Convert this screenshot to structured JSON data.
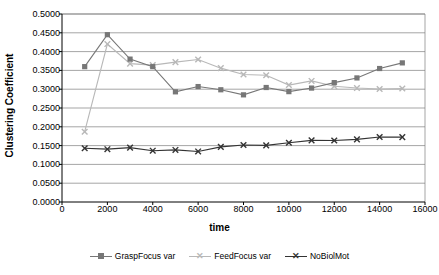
{
  "chart_data": {
    "type": "line",
    "title": "",
    "xlabel": "time",
    "ylabel": "Clustering Coefficient",
    "xlim": [
      0,
      16000
    ],
    "ylim": [
      0.0,
      0.5
    ],
    "grid": true,
    "legend_position": "bottom",
    "x_ticks": [
      "0",
      "2000",
      "4000",
      "6000",
      "8000",
      "10000",
      "12000",
      "14000",
      "16000"
    ],
    "x_tick_values": [
      0,
      2000,
      4000,
      6000,
      8000,
      10000,
      12000,
      14000,
      16000
    ],
    "y_ticks": [
      "0.0000",
      "0.0500",
      "0.1000",
      "0.1500",
      "0.2000",
      "0.2500",
      "0.3000",
      "0.3500",
      "0.4000",
      "0.4500",
      "0.5000"
    ],
    "y_tick_values": [
      0.0,
      0.05,
      0.1,
      0.15,
      0.2,
      0.25,
      0.3,
      0.35,
      0.4,
      0.45,
      0.5
    ],
    "x": [
      1000,
      2000,
      3000,
      4000,
      5000,
      6000,
      7000,
      8000,
      9000,
      10000,
      11000,
      12000,
      13000,
      14000,
      15000
    ],
    "series": [
      {
        "name": "GraspFocus var",
        "color": "#777777",
        "marker": "square",
        "values": [
          0.36,
          0.445,
          0.38,
          0.36,
          0.293,
          0.307,
          0.2985,
          0.285,
          0.3045,
          0.2935,
          0.303,
          0.3175,
          0.33,
          0.355,
          0.37
        ]
      },
      {
        "name": "FeedFocus var",
        "color": "#b8b8b8",
        "marker": "x",
        "values": [
          0.187,
          0.42,
          0.368,
          0.364,
          0.372,
          0.379,
          0.356,
          0.339,
          0.337,
          0.311,
          0.322,
          0.308,
          0.303,
          0.3005,
          0.302
        ]
      },
      {
        "name": "NoBiolMot",
        "color": "#333333",
        "marker": "x",
        "values": [
          0.143,
          0.1405,
          0.1445,
          0.1365,
          0.1385,
          0.1345,
          0.1465,
          0.1515,
          0.1505,
          0.1575,
          0.164,
          0.1635,
          0.1665,
          0.173,
          0.1725
        ]
      }
    ]
  },
  "legend": {
    "items": [
      {
        "label": "GraspFocus var",
        "color": "#777777",
        "marker": "square"
      },
      {
        "label": "FeedFocus var",
        "color": "#b8b8b8",
        "marker": "x"
      },
      {
        "label": "NoBiolMot",
        "color": "#333333",
        "marker": "x"
      }
    ]
  },
  "colors": {
    "plot_border": "#808080",
    "gridline": "#808080",
    "axis": "#000000",
    "background": "#ffffff"
  }
}
